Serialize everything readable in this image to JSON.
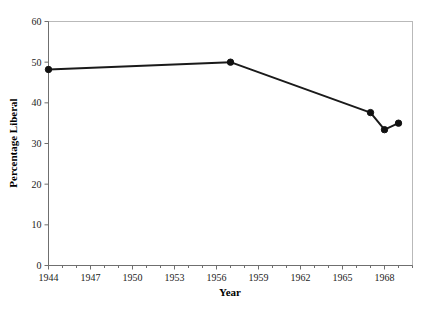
{
  "chart_data": {
    "type": "line",
    "title": "",
    "xlabel": "Year",
    "ylabel": "Percentage Liberal",
    "xlim": [
      1944,
      1970
    ],
    "ylim": [
      0,
      60
    ],
    "grid": false,
    "legend": "none",
    "x_ticks": [
      1944,
      1947,
      1950,
      1953,
      1956,
      1959,
      1962,
      1965,
      1968
    ],
    "x_tick_labels": [
      "1944",
      "1947",
      "1950",
      "1953",
      "1956",
      "1959",
      "1962",
      "1965",
      "1968"
    ],
    "y_ticks": [
      0,
      10,
      20,
      30,
      40,
      50,
      60
    ],
    "y_tick_labels": [
      "0",
      "10",
      "20",
      "30",
      "40",
      "50",
      "60"
    ],
    "series": [
      {
        "name": "Percentage Liberal",
        "marker": "circle",
        "color": "#111111",
        "x": [
          1944,
          1957,
          1967,
          1968,
          1969
        ],
        "values": [
          48.2,
          50.0,
          37.6,
          33.4,
          35.0
        ],
        "points": [
          {
            "x": 1944,
            "y": 48.2
          },
          {
            "x": 1957,
            "y": 50.0
          },
          {
            "x": 1967,
            "y": 37.6
          },
          {
            "x": 1968,
            "y": 33.4
          },
          {
            "x": 1969,
            "y": 35.0
          }
        ]
      }
    ]
  },
  "figure": {
    "background_color": "#ffffff",
    "line_color": "#111111",
    "frame_color": "#b9b9b9",
    "axis_color": "#6f6f6f"
  }
}
